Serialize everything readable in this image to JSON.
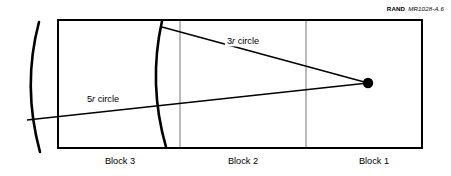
{
  "figure": {
    "credit": {
      "brand": "RAND",
      "tag": "MR1028-A.6"
    },
    "frame": {
      "x": 58,
      "y": 20,
      "width": 364,
      "height": 128,
      "stroke": "#000000",
      "stroke_width": 2
    },
    "dividers": [
      {
        "name": "divider-block3-block2",
        "x": 180,
        "stroke": "#808080"
      },
      {
        "name": "divider-block2-block1",
        "x": 306,
        "stroke": "#808080"
      }
    ],
    "source_point": {
      "label": "source-point",
      "cx": 368,
      "cy": 83,
      "r": 5.2,
      "fill": "#000000"
    },
    "arcs": [
      {
        "name": "five-r-arc",
        "label": "5r circle",
        "label_prefix": "5",
        "label_italic": "r",
        "label_suffix": " circle",
        "label_x": 103,
        "label_y": 100,
        "path": "M 39 22 Q 22 86 40 152",
        "stroke": "#000000",
        "stroke_width": 2.6
      },
      {
        "name": "three-r-arc",
        "label": "3r circle",
        "label_prefix": "3",
        "label_italic": "r",
        "label_suffix": " circle",
        "label_x": 243,
        "label_y": 42,
        "path": "M 162 21 Q 148 84 166 147",
        "stroke": "#000000",
        "stroke_width": 2.6
      }
    ],
    "rays": [
      {
        "name": "three-r-ray",
        "x1": 162,
        "y1": 27,
        "x2": 368,
        "y2": 83,
        "stroke": "#000000",
        "stroke_width": 1.6
      },
      {
        "name": "five-r-ray",
        "x1": 27,
        "y1": 120,
        "x2": 368,
        "y2": 83,
        "stroke": "#000000",
        "stroke_width": 1.6
      }
    ],
    "blocks": [
      {
        "name": "block-3",
        "label": "Block 3",
        "x": 120,
        "y": 157
      },
      {
        "name": "block-2",
        "label": "Block 2",
        "x": 243,
        "y": 157
      },
      {
        "name": "block-1",
        "label": "Block 1",
        "x": 374,
        "y": 157
      }
    ]
  }
}
